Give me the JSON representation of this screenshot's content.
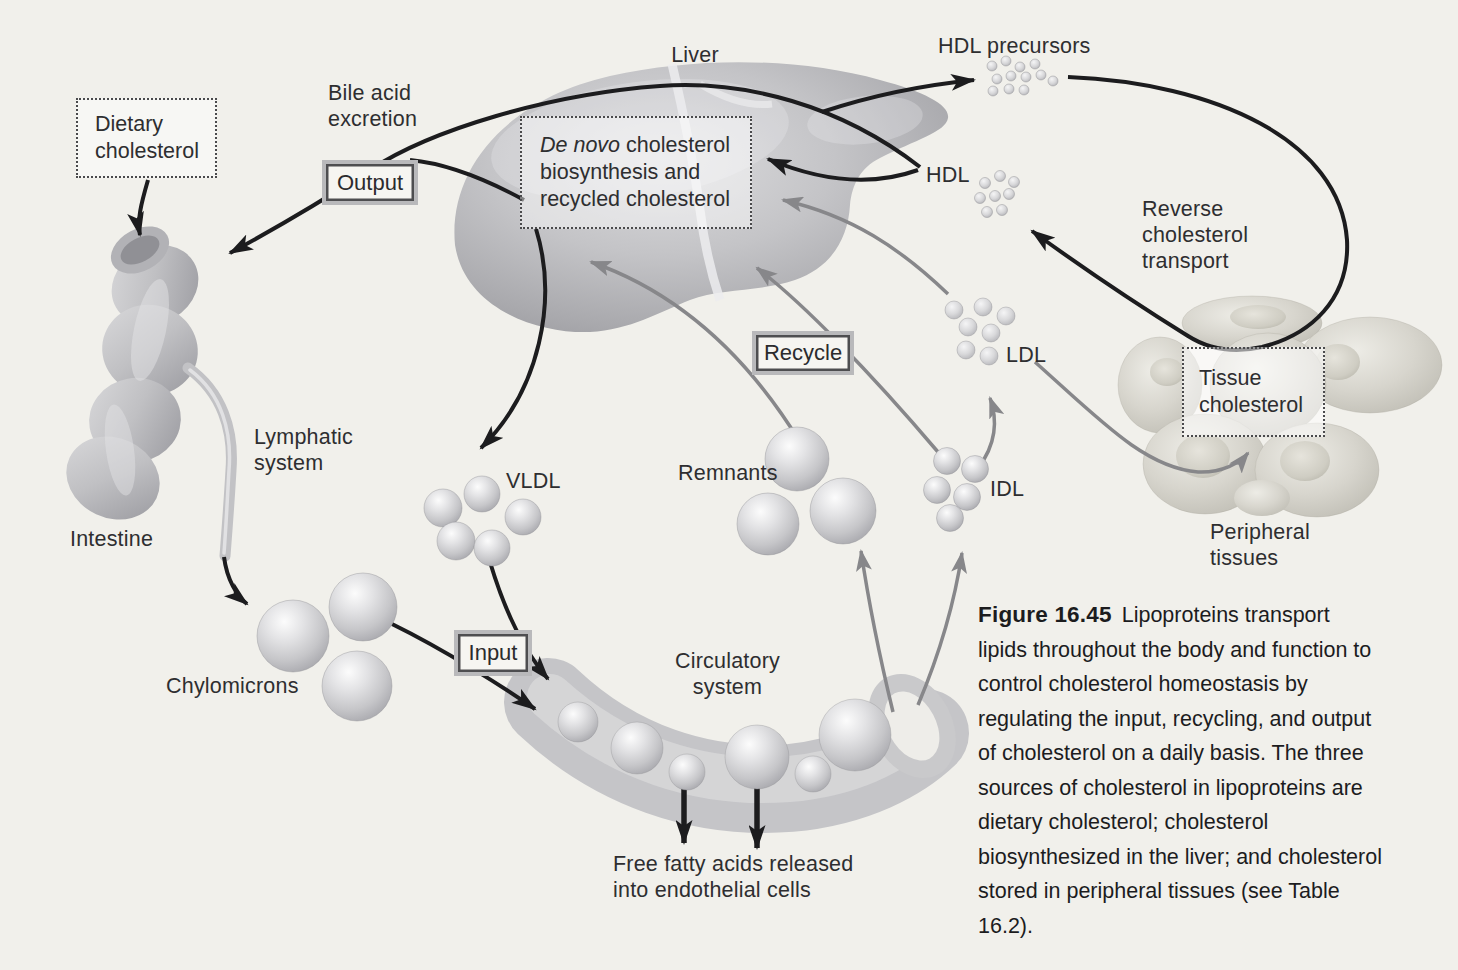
{
  "labels": {
    "liver": "Liver",
    "hdl_precursors": "HDL precursors",
    "hdl": "HDL",
    "reverse_transport": "Reverse cholesterol transport",
    "bile_acid": "Bile acid excretion",
    "dietary_cholesterol": "Dietary cholesterol",
    "de_novo_italic": "De novo",
    "de_novo_rest": " cholesterol biosynthesis and recycled cholesterol",
    "tissue_cholesterol": "Tissue cholesterol",
    "ldl": "LDL",
    "idl": "IDL",
    "vldl": "VLDL",
    "remnants": "Remnants",
    "lymphatic_system": "Lymphatic system",
    "intestine": "Intestine",
    "chylomicrons": "Chylomicrons",
    "circulatory_system": "Circulatory system",
    "peripheral_tissues": "Peripheral tissues",
    "free_fatty_acids": "Free fatty acids released into endothelial cells"
  },
  "process_boxes": {
    "output": "Output",
    "input": "Input",
    "recycle": "Recycle"
  },
  "caption": {
    "heading": "Figure 16.45",
    "body": "Lipoproteins transport lipids throughout the body and function to control cholesterol homeostasis by regulating the input, recycling, and output of cholesterol on a daily basis. The three sources of cholesterol in lipoproteins are dietary cholesterol; cholesterol biosynthesized in the liver; and cholesterol stored in peripheral tissues (see Table 16.2)."
  },
  "colors": {
    "background": "#f1f0eb",
    "arrow_black": "#1c1c1e",
    "arrow_gray": "#87878a",
    "text": "#2e2e30"
  }
}
